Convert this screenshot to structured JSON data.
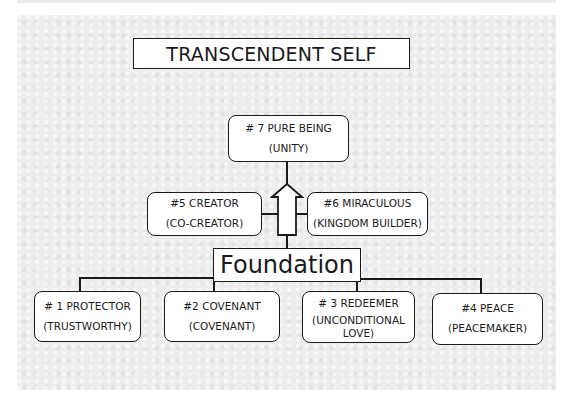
{
  "diagram": {
    "title": "TRANSCENDENT SELF",
    "apex": {
      "line1": "# 7 PURE BEING",
      "line2": "(UNITY)"
    },
    "middle": [
      {
        "line1": "#5 CREATOR",
        "line2": "(CO-CREATOR)"
      },
      {
        "line1": "#6  MIRACULOUS",
        "line2": "(KINGDOM BUILDER)"
      }
    ],
    "foundation": "Foundation",
    "base": [
      {
        "line1": "# 1 PROTECTOR",
        "line2": "(TRUSTWORTHY)"
      },
      {
        "line1": "#2 COVENANT",
        "line2": "(COVENANT)"
      },
      {
        "line1": "# 3 REDEEMER",
        "line2": "(UNCONDITIONAL LOVE)"
      },
      {
        "line1": "#4 PEACE",
        "line2": "(PEACEMAKER)"
      }
    ],
    "arrow": "up-arrow"
  }
}
